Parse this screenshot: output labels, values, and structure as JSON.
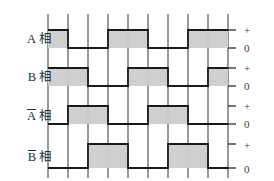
{
  "figure": {
    "top_caption": "",
    "background": "#ffffff",
    "line_color": "#1a1a1a",
    "fill_color": "#cccccc",
    "grid_color": "#9a9a9a",
    "tick_plus": "+",
    "tick_zero": "0"
  },
  "geometry": {
    "x_start": 48,
    "x_end": 228,
    "grid_top": 14,
    "grid_bottom": 178,
    "grid_x": [
      48,
      68,
      88,
      108,
      128,
      148,
      168,
      188,
      208,
      228
    ],
    "period": 80,
    "row_height": 38
  },
  "rows": [
    {
      "name": "a-phase",
      "label_main": "A",
      "label_suffix": "相",
      "overline": false,
      "y_high": 30,
      "y_low": 48,
      "label_y": 33,
      "plus_y": 25,
      "zero_y": 43,
      "segments": [
        {
          "from": 48,
          "to": 68,
          "level": "high"
        },
        {
          "from": 68,
          "to": 108,
          "level": "low"
        },
        {
          "from": 108,
          "to": 148,
          "level": "high"
        },
        {
          "from": 148,
          "to": 188,
          "level": "low"
        },
        {
          "from": 188,
          "to": 228,
          "level": "high"
        }
      ]
    },
    {
      "name": "b-phase",
      "label_main": "B",
      "label_suffix": "相",
      "overline": false,
      "y_high": 68,
      "y_low": 86,
      "label_y": 71,
      "plus_y": 63,
      "zero_y": 81,
      "segments": [
        {
          "from": 48,
          "to": 88,
          "level": "high"
        },
        {
          "from": 88,
          "to": 128,
          "level": "low"
        },
        {
          "from": 128,
          "to": 168,
          "level": "high"
        },
        {
          "from": 168,
          "to": 208,
          "level": "low"
        },
        {
          "from": 208,
          "to": 228,
          "level": "high"
        }
      ]
    },
    {
      "name": "a-bar-phase",
      "label_main": "A",
      "label_suffix": "相",
      "overline": true,
      "y_high": 106,
      "y_low": 124,
      "label_y": 109,
      "plus_y": 101,
      "zero_y": 119,
      "segments": [
        {
          "from": 48,
          "to": 68,
          "level": "low"
        },
        {
          "from": 68,
          "to": 108,
          "level": "high"
        },
        {
          "from": 108,
          "to": 148,
          "level": "low"
        },
        {
          "from": 148,
          "to": 188,
          "level": "high"
        },
        {
          "from": 188,
          "to": 228,
          "level": "low"
        }
      ]
    },
    {
      "name": "b-bar-phase",
      "label_main": "B",
      "label_suffix": "相",
      "overline": true,
      "y_high": 144,
      "y_low": 168,
      "label_y": 150,
      "plus_y": 140,
      "zero_y": 164,
      "segments": [
        {
          "from": 48,
          "to": 88,
          "level": "low"
        },
        {
          "from": 88,
          "to": 128,
          "level": "high"
        },
        {
          "from": 128,
          "to": 168,
          "level": "low"
        },
        {
          "from": 168,
          "to": 208,
          "level": "high"
        },
        {
          "from": 208,
          "to": 228,
          "level": "low"
        }
      ]
    }
  ],
  "chart_data": {
    "type": "line",
    "title": "",
    "xlabel": "",
    "ylabel": "",
    "series": [
      {
        "name": "A 相",
        "levels": [
          "+",
          "0",
          "+",
          "0",
          "+"
        ],
        "transitions_px": [
          48,
          68,
          108,
          148,
          188,
          228
        ]
      },
      {
        "name": "B 相",
        "levels": [
          "+",
          "0",
          "+",
          "0",
          "+"
        ],
        "transitions_px": [
          48,
          88,
          128,
          168,
          208,
          228
        ]
      },
      {
        "name": "A̅ 相",
        "levels": [
          "0",
          "+",
          "0",
          "+",
          "0"
        ],
        "transitions_px": [
          48,
          68,
          108,
          148,
          188,
          228
        ]
      },
      {
        "name": "B̅ 相",
        "levels": [
          "0",
          "+",
          "0",
          "+",
          "0"
        ],
        "transitions_px": [
          48,
          88,
          128,
          168,
          208,
          228
        ]
      }
    ],
    "yticks": [
      "+",
      "0"
    ],
    "grid": true,
    "legend": "none"
  }
}
